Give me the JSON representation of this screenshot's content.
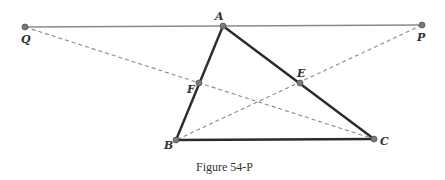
{
  "figure": {
    "caption": "Figure 54-P",
    "colors": {
      "triangle": "#2b2b2b",
      "top_line": "#8a8a8a",
      "dashed": "#8a8a8a",
      "point_fill": "#7a7a7a",
      "point_stroke": "#555555",
      "label": "#333333"
    },
    "points": [
      {
        "name": "Q",
        "x": 25,
        "y": 27,
        "label_dx": -4,
        "label_dy": 16
      },
      {
        "name": "A",
        "x": 223,
        "y": 26,
        "label_dx": -8,
        "label_dy": -6
      },
      {
        "name": "P",
        "x": 422,
        "y": 25,
        "label_dx": -5,
        "label_dy": 16
      },
      {
        "name": "F",
        "x": 199,
        "y": 83,
        "label_dx": -12,
        "label_dy": 10
      },
      {
        "name": "E",
        "x": 300,
        "y": 83,
        "label_dx": -3,
        "label_dy": -6
      },
      {
        "name": "B",
        "x": 176,
        "y": 140,
        "label_dx": -12,
        "label_dy": 9
      },
      {
        "name": "C",
        "x": 374,
        "y": 139,
        "label_dx": 6,
        "label_dy": 6
      }
    ],
    "solid_segments": [
      {
        "from": "Q",
        "to": "P",
        "style": "thin-gray"
      },
      {
        "from": "A",
        "to": "B",
        "style": "thick"
      },
      {
        "from": "B",
        "to": "C",
        "style": "thick"
      },
      {
        "from": "C",
        "to": "A",
        "style": "thick"
      }
    ],
    "dashed_segments": [
      {
        "from": "Q",
        "to": "C",
        "through": "F"
      },
      {
        "from": "P",
        "to": "B",
        "through": "E"
      }
    ]
  }
}
